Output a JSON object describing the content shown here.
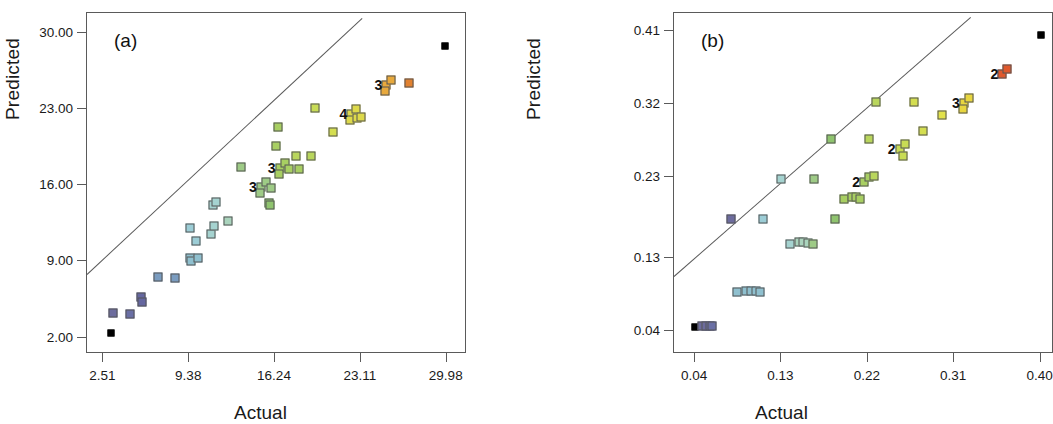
{
  "figure": {
    "panels": [
      {
        "letter": "(a)",
        "xlabel": "Actual",
        "ylabel": "Predicted",
        "xticks": [
          "2.51",
          "9.38",
          "16.24",
          "23.11",
          "29.98"
        ],
        "yticks": [
          "30.00",
          "23.00",
          "16.00",
          "9.00",
          "2.00"
        ]
      },
      {
        "letter": "(b)",
        "xlabel": "Actual",
        "ylabel": "Predicted",
        "xticks": [
          "0.04",
          "0.13",
          "0.22",
          "0.31",
          "0.40"
        ],
        "yticks": [
          "0.41",
          "0.32",
          "0.23",
          "0.13",
          "0.04"
        ]
      }
    ]
  },
  "chart_data": [
    {
      "type": "scatter",
      "panel": "(a)",
      "title": "",
      "xlabel": "Actual",
      "ylabel": "Predicted",
      "xlim": [
        1.2,
        31.6
      ],
      "ylim": [
        0.5,
        31.8
      ],
      "xticks": [
        2.51,
        9.38,
        16.24,
        23.11,
        29.98
      ],
      "yticks": [
        30.0,
        23.0,
        16.0,
        9.0,
        2.0
      ],
      "grid": false,
      "legend": false,
      "reference_line": {
        "x0": 1.2,
        "y0": 7.8,
        "x1": 23.2,
        "y1": 31.3
      },
      "points": [
        {
          "x": 3.1,
          "y": 2.45,
          "color": "#000000",
          "count": 1,
          "kind": "extreme"
        },
        {
          "x": 3.3,
          "y": 4.25,
          "color": "#6d6c9e",
          "count": 1
        },
        {
          "x": 4.6,
          "y": 4.2,
          "color": "#6a6fa5",
          "count": 1
        },
        {
          "x": 5.55,
          "y": 5.7,
          "color": "#6567a0",
          "count": 1
        },
        {
          "x": 5.6,
          "y": 5.25,
          "color": "#6567a0",
          "count": 1
        },
        {
          "x": 6.9,
          "y": 7.55,
          "color": "#7a9cc0",
          "count": 1
        },
        {
          "x": 8.2,
          "y": 7.5,
          "color": "#7a9cc0",
          "count": 1
        },
        {
          "x": 9.45,
          "y": 9.3,
          "color": "#8fc0cf",
          "count": 1
        },
        {
          "x": 9.55,
          "y": 9.0,
          "color": "#8fc0cf",
          "count": 1
        },
        {
          "x": 10.05,
          "y": 9.35,
          "color": "#8fc0cf",
          "count": 1
        },
        {
          "x": 9.4,
          "y": 12.1,
          "color": "#9ccdd6",
          "count": 1
        },
        {
          "x": 9.9,
          "y": 10.9,
          "color": "#9ccdd6",
          "count": 1
        },
        {
          "x": 11.1,
          "y": 11.55,
          "color": "#a5d3d0",
          "count": 1
        },
        {
          "x": 11.35,
          "y": 12.25,
          "color": "#a5d3d0",
          "count": 1
        },
        {
          "x": 11.25,
          "y": 14.15,
          "color": "#a5d3d0",
          "count": 1
        },
        {
          "x": 11.55,
          "y": 14.45,
          "color": "#a5d3d0",
          "count": 1
        },
        {
          "x": 12.45,
          "y": 12.7,
          "color": "#aad4bd",
          "count": 1
        },
        {
          "x": 13.55,
          "y": 17.65,
          "color": "#9ecb86",
          "count": 1
        },
        {
          "x": 15.1,
          "y": 15.8,
          "color": "#9ecb86",
          "count": 3,
          "label": "3"
        },
        {
          "x": 15.95,
          "y": 15.7,
          "color": "#9ecb86",
          "count": 1
        },
        {
          "x": 15.75,
          "y": 14.35,
          "color": "#8fc46e",
          "count": 1
        },
        {
          "x": 15.8,
          "y": 14.15,
          "color": "#8fc46e",
          "count": 1
        },
        {
          "x": 16.3,
          "y": 19.55,
          "color": "#a8cf62",
          "count": 1
        },
        {
          "x": 16.45,
          "y": 21.3,
          "color": "#a8cf62",
          "count": 1
        },
        {
          "x": 16.6,
          "y": 17.55,
          "color": "#a8cf62",
          "count": 3,
          "label": "3"
        },
        {
          "x": 17.35,
          "y": 17.5,
          "color": "#a8cf62",
          "count": 1
        },
        {
          "x": 18.15,
          "y": 17.45,
          "color": "#a8cf62",
          "count": 1
        },
        {
          "x": 17.9,
          "y": 18.7,
          "color": "#b9d65c",
          "count": 1
        },
        {
          "x": 19.1,
          "y": 18.65,
          "color": "#b9d65c",
          "count": 1
        },
        {
          "x": 19.45,
          "y": 23.05,
          "color": "#c8dc55",
          "count": 1
        },
        {
          "x": 20.85,
          "y": 20.85,
          "color": "#d4de50",
          "count": 1
        },
        {
          "x": 22.35,
          "y": 22.55,
          "color": "#ddd94a",
          "count": 4,
          "label": "4"
        },
        {
          "x": 23.15,
          "y": 22.25,
          "color": "#ddd94a",
          "count": 1
        },
        {
          "x": 25.15,
          "y": 25.2,
          "color": "#e8a93c",
          "count": 3,
          "label": "3"
        },
        {
          "x": 26.95,
          "y": 25.35,
          "color": "#e2812f",
          "count": 1
        },
        {
          "x": 29.8,
          "y": 28.75,
          "color": "#000000",
          "count": 1,
          "kind": "extreme"
        }
      ]
    },
    {
      "type": "scatter",
      "panel": "(b)",
      "title": "",
      "xlabel": "Actual",
      "ylabel": "Predicted",
      "xlim": [
        0.018,
        0.414
      ],
      "ylim": [
        0.012,
        0.432
      ],
      "xticks": [
        0.04,
        0.13,
        0.22,
        0.31,
        0.4
      ],
      "yticks": [
        0.41,
        0.32,
        0.23,
        0.13,
        0.04
      ],
      "grid": false,
      "legend": false,
      "reference_line": {
        "x0": 0.018,
        "y0": 0.108,
        "x1": 0.327,
        "y1": 0.427
      },
      "points": [
        {
          "x": 0.04,
          "y": 0.045,
          "color": "#000000",
          "count": 1,
          "kind": "extreme"
        },
        {
          "x": 0.047,
          "y": 0.046,
          "color": "#6d6c9e",
          "count": 1
        },
        {
          "x": 0.051,
          "y": 0.047,
          "color": "#6d6c9e",
          "count": 1
        },
        {
          "x": 0.055,
          "y": 0.047,
          "color": "#6a6fa5",
          "count": 1
        },
        {
          "x": 0.058,
          "y": 0.046,
          "color": "#6a6fa5",
          "count": 1
        },
        {
          "x": 0.084,
          "y": 0.088,
          "color": "#8fc0cf",
          "count": 1
        },
        {
          "x": 0.093,
          "y": 0.09,
          "color": "#8fc0cf",
          "count": 1
        },
        {
          "x": 0.098,
          "y": 0.09,
          "color": "#8fc0cf",
          "count": 1
        },
        {
          "x": 0.103,
          "y": 0.089,
          "color": "#8fc0cf",
          "count": 1
        },
        {
          "x": 0.108,
          "y": 0.088,
          "color": "#8fc0cf",
          "count": 1
        },
        {
          "x": 0.077,
          "y": 0.178,
          "color": "#6d6c9e",
          "count": 1
        },
        {
          "x": 0.111,
          "y": 0.178,
          "color": "#9ccdd6",
          "count": 1
        },
        {
          "x": 0.129,
          "y": 0.228,
          "color": "#a5d3d0",
          "count": 1
        },
        {
          "x": 0.139,
          "y": 0.148,
          "color": "#a5d3d0",
          "count": 1
        },
        {
          "x": 0.148,
          "y": 0.15,
          "color": "#aad4bd",
          "count": 1
        },
        {
          "x": 0.152,
          "y": 0.15,
          "color": "#aad4bd",
          "count": 1
        },
        {
          "x": 0.158,
          "y": 0.149,
          "color": "#aad4bd",
          "count": 1
        },
        {
          "x": 0.163,
          "y": 0.148,
          "color": "#9ecb86",
          "count": 1
        },
        {
          "x": 0.164,
          "y": 0.227,
          "color": "#9ecb86",
          "count": 1
        },
        {
          "x": 0.182,
          "y": 0.277,
          "color": "#8fc46e",
          "count": 1
        },
        {
          "x": 0.186,
          "y": 0.178,
          "color": "#8fc46e",
          "count": 1
        },
        {
          "x": 0.195,
          "y": 0.203,
          "color": "#a8cf62",
          "count": 1
        },
        {
          "x": 0.203,
          "y": 0.205,
          "color": "#a8cf62",
          "count": 1
        },
        {
          "x": 0.208,
          "y": 0.205,
          "color": "#a8cf62",
          "count": 1
        },
        {
          "x": 0.212,
          "y": 0.203,
          "color": "#a8cf62",
          "count": 1
        },
        {
          "x": 0.216,
          "y": 0.224,
          "color": "#a8cf62",
          "count": 2,
          "label": "2"
        },
        {
          "x": 0.221,
          "y": 0.277,
          "color": "#b9d65c",
          "count": 1
        },
        {
          "x": 0.226,
          "y": 0.231,
          "color": "#b9d65c",
          "count": 1
        },
        {
          "x": 0.228,
          "y": 0.322,
          "color": "#b9d65c",
          "count": 1
        },
        {
          "x": 0.253,
          "y": 0.264,
          "color": "#c8dc55",
          "count": 2,
          "label": "2"
        },
        {
          "x": 0.257,
          "y": 0.256,
          "color": "#c8dc55",
          "count": 1
        },
        {
          "x": 0.268,
          "y": 0.322,
          "color": "#d4de50",
          "count": 1
        },
        {
          "x": 0.278,
          "y": 0.287,
          "color": "#d4de50",
          "count": 1
        },
        {
          "x": 0.297,
          "y": 0.306,
          "color": "#e2e24a",
          "count": 1
        },
        {
          "x": 0.32,
          "y": 0.321,
          "color": "#e8d63f",
          "count": 3,
          "label": "3"
        },
        {
          "x": 0.36,
          "y": 0.357,
          "color": "#e0582c",
          "count": 2,
          "label": "2"
        },
        {
          "x": 0.4,
          "y": 0.405,
          "color": "#000000",
          "count": 1,
          "kind": "extreme"
        }
      ]
    }
  ]
}
